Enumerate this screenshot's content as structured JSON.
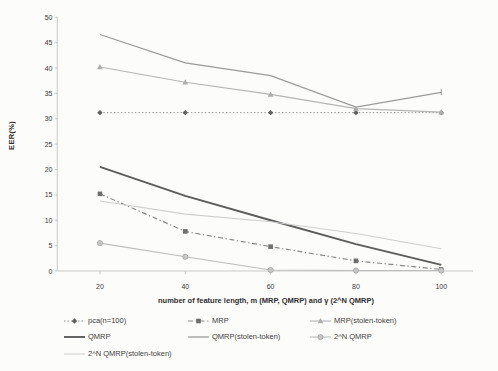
{
  "chart_data": {
    "type": "line",
    "title": "",
    "xlabel": "number of feature length, m (MRP, QMRP) and γ (2^N QMRP)",
    "ylabel": "EER(%)",
    "x": [
      20,
      40,
      60,
      80,
      100
    ],
    "x_tick_labels": [
      "20",
      "40",
      "60",
      "80",
      "100"
    ],
    "y_ticks": [
      0,
      5,
      10,
      15,
      20,
      25,
      30,
      35,
      40,
      45,
      50
    ],
    "xlim": [
      10,
      110
    ],
    "ylim": [
      0,
      50
    ],
    "grid": false,
    "legend_position": "bottom-left",
    "axis_color": "#c9c9c9",
    "tick_label_color": "#3a3a3a",
    "series": [
      {
        "name": "pca(n=100)",
        "values": [
          31.2,
          31.2,
          31.2,
          31.2,
          31.2
        ],
        "color": "#8f8f8f",
        "dash": "dotted",
        "marker": "diamond",
        "marker_color": "#5f5f5f",
        "width": 1
      },
      {
        "name": "MRP",
        "values": [
          15.2,
          7.8,
          4.8,
          2.0,
          0.3
        ],
        "color": "#8a8a8a",
        "dash": "dashdot",
        "marker": "square",
        "marker_color": "#6e6e6e",
        "width": 1.2
      },
      {
        "name": "MRP(stolen-token)",
        "values": [
          40.2,
          37.2,
          34.8,
          32.0,
          31.3
        ],
        "color": "#b5b5b5",
        "dash": "solid",
        "marker": "triangle",
        "marker_color": "#aeaeae",
        "width": 1.1
      },
      {
        "name": "QMRP",
        "values": [
          20.5,
          14.8,
          10.0,
          5.3,
          1.2
        ],
        "color": "#5c5c5c",
        "dash": "solid",
        "marker": "none",
        "marker_color": "#5c5c5c",
        "width": 1.9
      },
      {
        "name": "QMRP(stolen-token)",
        "values": [
          46.6,
          41.0,
          38.5,
          32.3,
          35.2
        ],
        "color": "#9b9b9b",
        "dash": "solid",
        "marker": "endtick",
        "marker_color": "#9b9b9b",
        "width": 1.3
      },
      {
        "name": "2^N QMRP",
        "values": [
          5.5,
          2.8,
          0.2,
          0.1,
          0.1
        ],
        "color": "#bdbdbd",
        "dash": "solid",
        "marker": "circle",
        "marker_color": "#c6c6c6",
        "width": 1.1
      },
      {
        "name": "2^N QMRP(stolen-token)",
        "values": [
          13.8,
          11.2,
          9.7,
          7.4,
          4.4
        ],
        "color": "#cfcfcf",
        "dash": "solid",
        "marker": "none",
        "marker_color": "#cfcfcf",
        "width": 1.1
      }
    ]
  }
}
